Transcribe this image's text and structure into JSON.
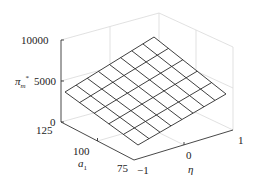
{
  "chart_data": {
    "type": "surface3d",
    "title": "",
    "zlabel": "π_m*",
    "xlabel": "η",
    "ylabel": "a_1",
    "z_ticks": [
      "0",
      "5000",
      "10000"
    ],
    "x_ticks": [
      "-1",
      "0",
      "1"
    ],
    "y_ticks": [
      "75",
      "100",
      "125"
    ],
    "zlim": [
      0,
      10000
    ],
    "xlim": [
      -1,
      1
    ],
    "ylim": [
      75,
      125
    ],
    "grid": true,
    "grid_cells": {
      "eta": 8,
      "a1": 5
    },
    "corner_values": [
      {
        "eta": -1,
        "a1": 125,
        "z": 4200
      },
      {
        "eta": 1,
        "a1": 125,
        "z": 8400
      },
      {
        "eta": 1,
        "a1": 75,
        "z": 4800
      },
      {
        "eta": -1,
        "a1": 75,
        "z": 2400
      }
    ]
  },
  "labels": {
    "z_axis": "π",
    "z_axis_sub": "m",
    "z_axis_sup": "*",
    "a1_axis": "a",
    "a1_sub": "1",
    "eta_axis": "η",
    "z10000": "10000",
    "z5000": "5000",
    "z0": "0",
    "a125": "125",
    "a100": "100",
    "a75": "75",
    "eneg1": "−1",
    "e0": "0",
    "e1": "1"
  },
  "geometry": {
    "surface_corners": {
      "left": [
        65,
        92
      ],
      "top": [
        154,
        37
      ],
      "right": [
        226,
        94
      ],
      "bottom": [
        138,
        145
      ]
    }
  }
}
